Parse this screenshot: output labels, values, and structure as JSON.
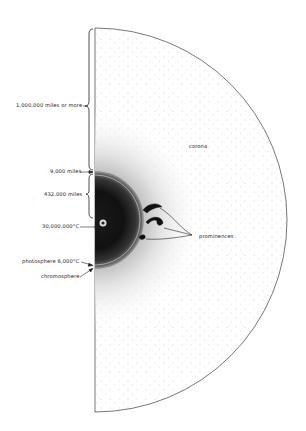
{
  "diagram": {
    "labels": {
      "corona_extent": "1,000,000 miles or more",
      "chromosphere_thickness": "9,000 miles",
      "sun_radius": "432,000 miles",
      "core_temperature": "30,000,000°C",
      "photosphere": "photosphere 6,000°C",
      "chromosphere": "chromosphere",
      "corona": "corona",
      "prominences": "prominences"
    },
    "colors": {
      "ink": "#222222",
      "background": "#ffffff"
    }
  }
}
